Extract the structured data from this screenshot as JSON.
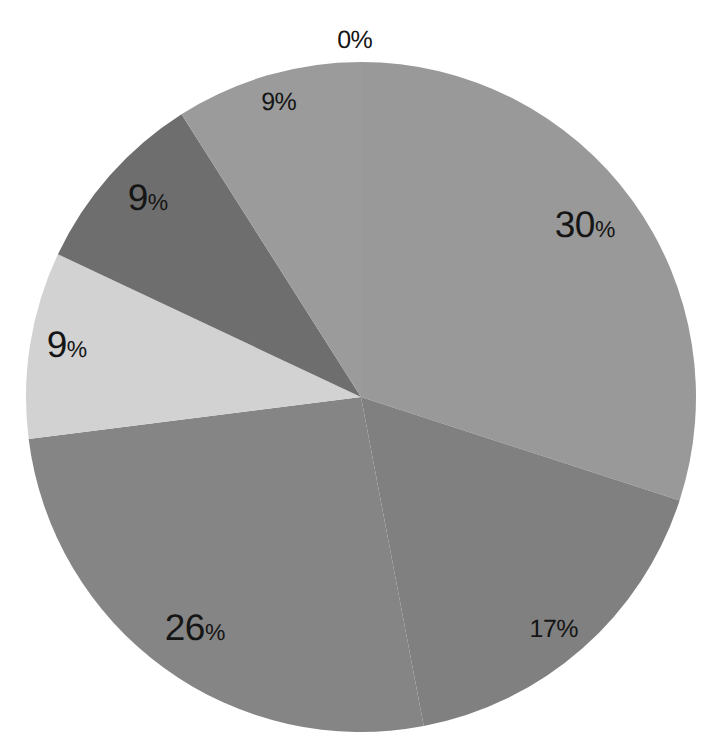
{
  "chart_data": {
    "type": "pie",
    "title": "",
    "subtitle": "",
    "xlabel": "",
    "ylabel": "",
    "grid": false,
    "legend": "none",
    "units": "percent",
    "start_angle_deg": 0,
    "direction": "clockwise",
    "background": "#ffffff",
    "categories": [
      "Slice 1",
      "Slice 2",
      "Slice 3",
      "Slice 4",
      "Slice 5",
      "Slice 6",
      "Slice 7"
    ],
    "values": [
      0,
      30,
      17,
      26,
      9,
      9,
      9
    ],
    "labels": [
      "0%",
      "30%",
      "17%",
      "26%",
      "9%",
      "9%",
      "9%"
    ],
    "colors": [
      "#9b9b9b",
      "#999999",
      "#808080",
      "#858585",
      "#d2d2d2",
      "#6e6e6e",
      "#9b9b9b"
    ],
    "slices": [
      {
        "label": "0%",
        "value": 0,
        "color": "#9b9b9b",
        "start_deg": 0,
        "end_deg": 0,
        "label_x": 355,
        "label_y": 40,
        "label_size": "small",
        "label_style": "uniform",
        "digits": "0",
        "percent_sign": "%"
      },
      {
        "label": "30%",
        "value": 30,
        "color": "#999999",
        "start_deg": 0,
        "end_deg": 108,
        "label_x": 585,
        "label_y": 224,
        "label_size": "big",
        "label_style": "mixed",
        "digits": "30",
        "percent_sign": "%"
      },
      {
        "label": "17%",
        "value": 17,
        "color": "#808080",
        "start_deg": 108,
        "end_deg": 169.2,
        "label_x": 554,
        "label_y": 629,
        "label_size": "small",
        "label_style": "uniform",
        "digits": "17",
        "percent_sign": "%"
      },
      {
        "label": "26%",
        "value": 26,
        "color": "#858585",
        "start_deg": 169.2,
        "end_deg": 262.8,
        "label_x": 195,
        "label_y": 627,
        "label_size": "big",
        "label_style": "mixed",
        "digits": "26",
        "percent_sign": "%"
      },
      {
        "label": "9%",
        "value": 9,
        "color": "#d2d2d2",
        "start_deg": 262.8,
        "end_deg": 295.2,
        "label_x": 67,
        "label_y": 344,
        "label_size": "big",
        "label_style": "mixed",
        "digits": "9",
        "percent_sign": "%"
      },
      {
        "label": "9%",
        "value": 9,
        "color": "#6e6e6e",
        "start_deg": 295.2,
        "end_deg": 327.6,
        "label_x": 148,
        "label_y": 197,
        "label_size": "big",
        "label_style": "mixed",
        "digits": "9",
        "percent_sign": "%"
      },
      {
        "label": "9%",
        "value": 9,
        "color": "#9b9b9b",
        "start_deg": 327.6,
        "end_deg": 360,
        "label_x": 279,
        "label_y": 102,
        "label_size": "small",
        "label_style": "uniform",
        "digits": "9",
        "percent_sign": "%"
      }
    ],
    "geometry": {
      "center_x": 361,
      "center_y": 397,
      "radius": 335
    }
  }
}
